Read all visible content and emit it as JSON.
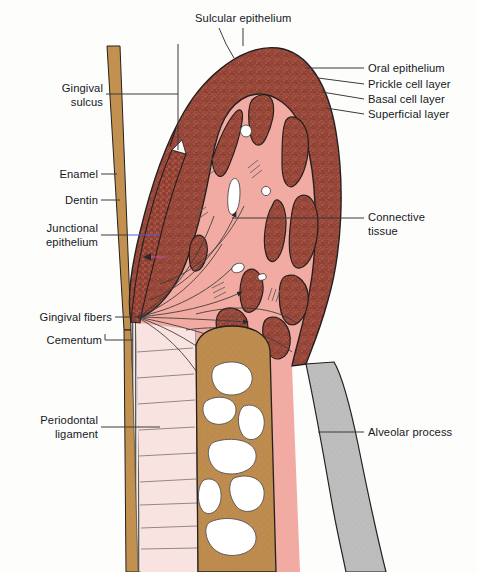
{
  "figure": {
    "background_color": "#fdfdfc"
  },
  "labels_left": [
    {
      "id": "gingival-sulcus",
      "text": "Gingival\nsulcus",
      "x": 47,
      "y": 88,
      "leader": "from text right edge horizontally to the sulcus line at the tooth surface"
    },
    {
      "id": "enamel",
      "text": "Enamel",
      "x": 57,
      "y": 168,
      "leader": "horizontal line to enamel strip"
    },
    {
      "id": "dentin",
      "text": "Dentin",
      "x": 59,
      "y": 194,
      "leader": "horizontal line to dentin"
    },
    {
      "id": "junctional-epithelium",
      "text": "Junctional\nepithelium",
      "x": 40,
      "y": 224,
      "leader": "horizontal line, blue segment, to junctional epithelium"
    },
    {
      "id": "gingival-fibers",
      "text": "Gingival fibers",
      "x": 24,
      "y": 311,
      "leader": "horizontal line to fiber origin at cementum"
    },
    {
      "id": "cementum",
      "text": "Cementum",
      "x": 36,
      "y": 334,
      "leader": "horizontal line to cementum strip"
    },
    {
      "id": "periodontal-ligament",
      "text": "Periodontal\nligament",
      "x": 30,
      "y": 421,
      "leader": "horizontal line to periodontal ligament space"
    }
  ],
  "labels_right": [
    {
      "id": "oral-epithelium",
      "text": "Oral epithelium",
      "x": 368,
      "y": 68,
      "leader": "horizontal line to outer epithelium surface"
    },
    {
      "id": "prickle-cell-layer",
      "text": "Prickle cell layer",
      "x": 368,
      "y": 84,
      "leader": "line to prickle cell layer"
    },
    {
      "id": "basal-cell-layer",
      "text": "Basal cell layer",
      "x": 368,
      "y": 99,
      "leader": "line to basal cell layer"
    },
    {
      "id": "superficial-layer",
      "text": "Superficial layer",
      "x": 368,
      "y": 114,
      "leader": "line to superficial layer"
    },
    {
      "id": "connective-tissue",
      "text": "Connective\ntissue",
      "x": 368,
      "y": 212,
      "leader": "horizontal line into pink connective tissue core"
    },
    {
      "id": "alveolar-process",
      "text": "Alveolar process",
      "x": 368,
      "y": 427,
      "leader": "horizontal line to gray alveolar bone plate"
    }
  ],
  "labels_top": [
    {
      "id": "sulcular-epithelium",
      "text": "Sulcular epithelium",
      "x": 195,
      "y": 14,
      "leader": "two lines descending to the sulcular crest region"
    }
  ],
  "colors": {
    "epithelium_fill": "#b0594a",
    "epithelium_cell_dark": "#8e4034",
    "connective_tissue": "#f2aba2",
    "connective_tissue_light": "#f7cdc6",
    "enamel_dentin": "#c2914f",
    "alveolar_bone": "#bd8c4e",
    "cortical_plate": "#bdbdbd",
    "marrow_space": "#ffffff",
    "pdl_space": "#f9e3e0",
    "outline": "#23201e",
    "leader_line": "#3b3b3b",
    "junctional_leader_accent": "#5560d0",
    "text": "#15181c"
  }
}
